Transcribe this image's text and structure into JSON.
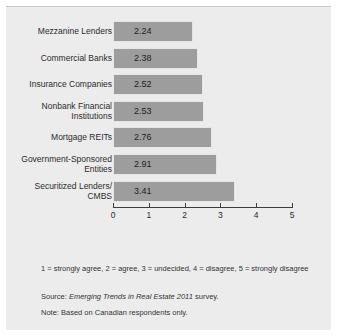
{
  "chart_data": {
    "type": "bar",
    "orientation": "horizontal",
    "title": "",
    "xlabel": "",
    "ylabel": "",
    "xlim": [
      0,
      5
    ],
    "xticks": [
      0,
      1,
      2,
      3,
      4,
      5
    ],
    "grid": false,
    "legend": null,
    "bar_color": "#9d9d9d",
    "background_color": "#ececec",
    "categories": [
      "Mezzanine Lenders",
      "Commercial Banks",
      "Insurance Companies",
      "Nonbank Financial\nInstitutions",
      "Mortgage REITs",
      "Government-Sponsored\nEntities",
      "Securitized Lenders/\nCMBS"
    ],
    "values": [
      2.24,
      2.38,
      2.52,
      2.53,
      2.76,
      2.91,
      3.41
    ],
    "value_labels": [
      "2.24",
      "2.38",
      "2.52",
      "2.53",
      "2.76",
      "2.91",
      "3.41"
    ],
    "annotations": {
      "scale_note": "1 = strongly agree, 2 = agree, 3 = undecided, 4 = disagree, 5 = strongly disagree",
      "source_prefix": "Source: ",
      "source_italic": "Emerging Trends in Real Estate 2011",
      "source_suffix": " survey.",
      "base_note": "Note: Based on Canadian respondents only."
    }
  }
}
